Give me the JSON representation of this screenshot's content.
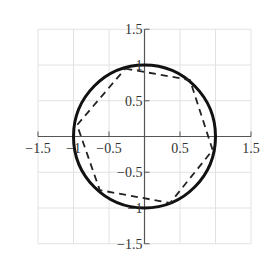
{
  "chart_data": {
    "type": "line",
    "title": "",
    "xlabel": "",
    "ylabel": "",
    "xlim": [
      -1.5,
      1.5
    ],
    "ylim": [
      -1.5,
      1.5
    ],
    "grid": true,
    "aspect": "equal",
    "x_ticks": [
      -1.5,
      -1,
      -0.5,
      0.5,
      1.5
    ],
    "x_tick_labels": [
      "-1.5",
      "-1",
      "-0.5",
      "0.5",
      "1.5"
    ],
    "y_ticks": [
      1.5,
      1,
      0.5,
      -0.5,
      -1,
      -1.5
    ],
    "y_tick_labels": [
      "1.5",
      "1",
      "0.5",
      "-0.5",
      "-1",
      "-1.5"
    ],
    "series": [
      {
        "name": "unit circle",
        "style": "solid",
        "color": "#111111",
        "shape": "circle",
        "center": [
          0,
          0
        ],
        "radius": 1
      },
      {
        "name": "inscribed hexagon",
        "style": "dashed",
        "color": "#222222",
        "shape": "polygon",
        "x": [
          -0.27,
          0.64,
          0.96,
          0.36,
          -0.63,
          -0.95,
          -0.27
        ],
        "y": [
          0.95,
          0.79,
          -0.19,
          -0.93,
          -0.75,
          0.16,
          0.95
        ]
      }
    ]
  },
  "axes": {
    "x_labels": [
      "−1.5",
      "−1",
      "−0.5",
      "0.5",
      "1.5"
    ],
    "y_labels": [
      "1.5",
      "1",
      "0.5",
      "−0.5",
      "−1",
      "−1.5"
    ]
  },
  "colors": {
    "grid": "#e2e2e2",
    "axis": "#555555",
    "circle": "#111111",
    "polygon": "#222222"
  }
}
